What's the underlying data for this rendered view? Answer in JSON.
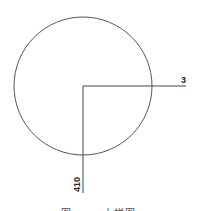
{
  "diagram": {
    "circle": {
      "cx": 83,
      "cy": 86,
      "r": 69,
      "stroke": "#555555"
    },
    "leaders": {
      "horizontal": {
        "x1": 83,
        "y1": 86,
        "x2": 186,
        "y2": 86,
        "label": "3"
      },
      "vertical": {
        "x1": 83,
        "y1": 86,
        "x2": 83,
        "y2": 193,
        "label": "410"
      }
    },
    "caption": "图 —— 大样图"
  }
}
